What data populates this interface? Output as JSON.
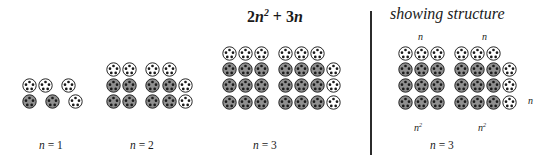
{
  "figure": {
    "formula": "2n² + 3n",
    "formula_parts": {
      "coef1": "2",
      "var_sq": "n",
      "exp": "2",
      "plus": "+",
      "coef2": "3",
      "var": "n"
    },
    "panel_title": "showing structure",
    "divider": "vertical-rule"
  },
  "colors": {
    "filled": "#8f8f8f",
    "empty": "#ffffff",
    "outline": "#262626",
    "dot": "#1a1a1a",
    "text": "#1a1a1a",
    "background": "#ffffff"
  },
  "legend": {
    "filled_meaning": "n-squared block token",
    "empty_meaning": "3n extra token"
  },
  "chart_data": {
    "type": "diagram",
    "subtitle": "showing structure",
    "token_types": [
      "filled",
      "empty"
    ],
    "groups": [
      {
        "id": "n1",
        "caption_prefix": "n",
        "caption_eq": "=",
        "caption_value": "1",
        "n": 1,
        "total_tokens": 5,
        "filled_tokens": 2,
        "empty_tokens": 3,
        "blocks": {
          "square_blocks": 2,
          "block_size": "1×1",
          "top_row_empty": 2,
          "right_column_empty": 1
        },
        "rows": [
          [
            "empty",
            "empty",
            "gap",
            "empty",
            "gap"
          ],
          [
            "filled",
            "gap",
            "filled",
            "gap",
            "empty"
          ]
        ]
      },
      {
        "id": "n2",
        "caption_prefix": "n",
        "caption_eq": "=",
        "caption_value": "2",
        "n": 2,
        "total_tokens": 14,
        "filled_tokens": 8,
        "empty_tokens": 6,
        "blocks": {
          "square_blocks": 2,
          "block_size": "2×2",
          "top_row_empty": 4,
          "right_column_empty": 2
        },
        "rows": [
          [
            "empty",
            "empty",
            "gap",
            "empty",
            "empty",
            "gap"
          ],
          [
            "filled",
            "filled",
            "gap",
            "filled",
            "filled",
            "empty"
          ],
          [
            "filled",
            "filled",
            "gap",
            "filled",
            "filled",
            "empty"
          ]
        ]
      },
      {
        "id": "n3",
        "caption_prefix": "n",
        "caption_eq": "=",
        "caption_value": "3",
        "n": 3,
        "total_tokens": 27,
        "filled_tokens": 18,
        "empty_tokens": 9,
        "blocks": {
          "square_blocks": 2,
          "block_size": "3×3",
          "top_row_empty": 6,
          "right_column_empty": 3
        },
        "rows": [
          [
            "empty",
            "empty",
            "empty",
            "gap",
            "empty",
            "empty",
            "empty",
            "gap"
          ],
          [
            "filled",
            "filled",
            "filled",
            "gap",
            "filled",
            "filled",
            "filled",
            "empty"
          ],
          [
            "filled",
            "filled",
            "filled",
            "gap",
            "filled",
            "filled",
            "filled",
            "empty"
          ],
          [
            "filled",
            "filled",
            "filled",
            "gap",
            "filled",
            "filled",
            "filled",
            "empty"
          ]
        ]
      },
      {
        "id": "n3-structure",
        "caption_prefix": "n",
        "caption_eq": "=",
        "caption_value": "3",
        "n": 3,
        "total_tokens": 27,
        "filled_tokens": 18,
        "empty_tokens": 9,
        "blocks": {
          "square_blocks": 2,
          "block_size": "3×3",
          "top_row_empty": 6,
          "right_column_empty": 3
        },
        "rows": [
          [
            "empty",
            "empty",
            "empty",
            "gap",
            "empty",
            "empty",
            "empty",
            "gap"
          ],
          [
            "filled",
            "filled",
            "filled",
            "gap",
            "filled",
            "filled",
            "filled",
            "empty"
          ],
          [
            "filled",
            "filled",
            "filled",
            "gap",
            "filled",
            "filled",
            "filled",
            "empty"
          ],
          [
            "filled",
            "filled",
            "filled",
            "gap",
            "filled",
            "filled",
            "filled",
            "empty"
          ]
        ],
        "annotations": {
          "top_left": "n",
          "top_right": "n",
          "right_side": "n",
          "bottom_left_base": "n",
          "bottom_left_exp": "2",
          "bottom_right_base": "n",
          "bottom_right_exp": "2"
        }
      }
    ]
  }
}
